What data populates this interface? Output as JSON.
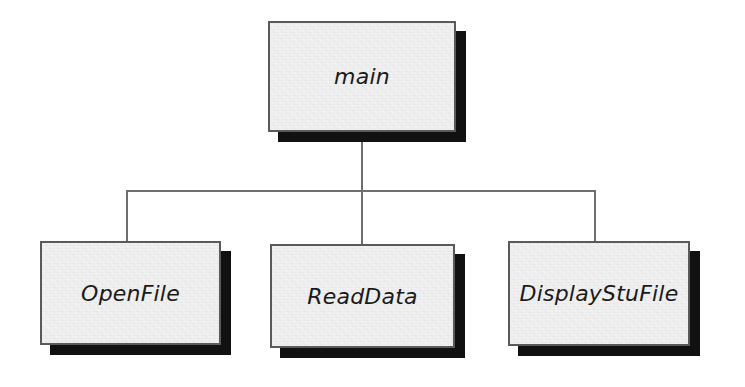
{
  "diagram": {
    "type": "structure-chart",
    "title": "",
    "background_color": "#ffffff",
    "box_fill_color": "#ededed",
    "box_border_color": "#5a5a5a",
    "box_shadow_color": "#111111",
    "connector_color": "#6e6e6e",
    "nodes": [
      {
        "id": "main",
        "label": "main",
        "level": 0
      },
      {
        "id": "openfile",
        "label": "OpenFile",
        "level": 1
      },
      {
        "id": "readdata",
        "label": "ReadData",
        "level": 1
      },
      {
        "id": "display",
        "label": "DisplayStuFile",
        "level": 1
      }
    ],
    "edges": [
      {
        "from": "main",
        "to": "openfile"
      },
      {
        "from": "main",
        "to": "readdata"
      },
      {
        "from": "main",
        "to": "display"
      }
    ]
  }
}
